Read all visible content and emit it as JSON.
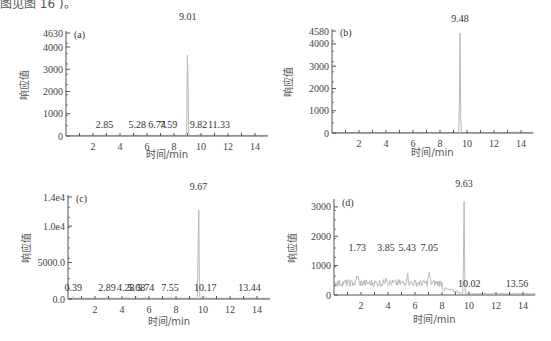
{
  "caption": "图见图 16 )。",
  "chart_data": [
    {
      "type": "line",
      "panel": "(a)",
      "xlabel": "时间/min",
      "ylabel": "响应值",
      "xlim": [
        0,
        15
      ],
      "ylim": [
        0,
        4630
      ],
      "x_ticks": [
        "2",
        "4",
        "6",
        "8",
        "10",
        "12",
        "14"
      ],
      "y_ticks": [
        "0",
        "1000",
        "2000",
        "3000",
        "4000",
        "4630"
      ],
      "peaks": [
        {
          "rt": 2.85,
          "label": "2.85",
          "height": 60
        },
        {
          "rt": 5.28,
          "label": "5.28",
          "height": 40
        },
        {
          "rt": 6.74,
          "label": "6.74",
          "height": 40
        },
        {
          "rt": 7.59,
          "label": "7.59",
          "height": 40
        },
        {
          "rt": 9.01,
          "label": "9.01",
          "height": 4630
        },
        {
          "rt": 9.82,
          "label": "9.82",
          "height": 60
        },
        {
          "rt": 11.33,
          "label": "11.33",
          "height": 40
        }
      ]
    },
    {
      "type": "line",
      "panel": "(b)",
      "xlabel": "时间/min",
      "ylabel": "响应值",
      "xlim": [
        0,
        15
      ],
      "ylim": [
        0,
        4580
      ],
      "x_ticks": [
        "2",
        "4",
        "6",
        "8",
        "10",
        "12",
        "14"
      ],
      "y_ticks": [
        "0",
        "1000",
        "2000",
        "3000",
        "4000",
        "4580"
      ],
      "peaks": [
        {
          "rt": 9.48,
          "label": "9.48",
          "height": 4580
        }
      ]
    },
    {
      "type": "line",
      "panel": "(c)",
      "xlabel": "时间/min",
      "ylabel": "响应值",
      "xlim": [
        0,
        15
      ],
      "ylim": [
        0,
        14000
      ],
      "x_ticks": [
        "2",
        "4",
        "6",
        "8",
        "10",
        "12",
        "14"
      ],
      "y_ticks": [
        "0.0",
        "5000.0",
        "1.0e4",
        "1.4e4"
      ],
      "peaks": [
        {
          "rt": 0.39,
          "label": "0.39",
          "height": 400
        },
        {
          "rt": 2.89,
          "label": "2.89",
          "height": 300
        },
        {
          "rt": 4.28,
          "label": "4.28",
          "height": 300
        },
        {
          "rt": 5.08,
          "label": "5.08",
          "height": 250
        },
        {
          "rt": 5.74,
          "label": "5.74",
          "height": 250
        },
        {
          "rt": 7.55,
          "label": "7.55",
          "height": 250
        },
        {
          "rt": 9.67,
          "label": "9.67",
          "height": 14000
        },
        {
          "rt": 10.17,
          "label": "10.17",
          "height": 400
        },
        {
          "rt": 13.44,
          "label": "13.44",
          "height": 200
        }
      ]
    },
    {
      "type": "line",
      "panel": "(d)",
      "xlabel": "时间/min",
      "ylabel": "响应值",
      "xlim": [
        0,
        15
      ],
      "ylim": [
        0,
        3200
      ],
      "x_ticks": [
        "2",
        "4",
        "6",
        "8",
        "10",
        "12",
        "14"
      ],
      "y_ticks": [
        "0",
        "1000",
        "2000",
        "3000"
      ],
      "peaks": [
        {
          "rt": 1.73,
          "label": "1.73",
          "height": 450
        },
        {
          "rt": 3.85,
          "label": "3.85",
          "height": 450
        },
        {
          "rt": 5.43,
          "label": "5.43",
          "height": 500
        },
        {
          "rt": 7.05,
          "label": "7.05",
          "height": 500
        },
        {
          "rt": 9.63,
          "label": "9.63",
          "height": 3200
        },
        {
          "rt": 10.02,
          "label": "10.02",
          "height": 100
        },
        {
          "rt": 13.56,
          "label": "13.56",
          "height": 50
        }
      ]
    }
  ],
  "colors": {
    "axis": "#555555",
    "trace": "#b8b8b8",
    "text": "#333333"
  }
}
